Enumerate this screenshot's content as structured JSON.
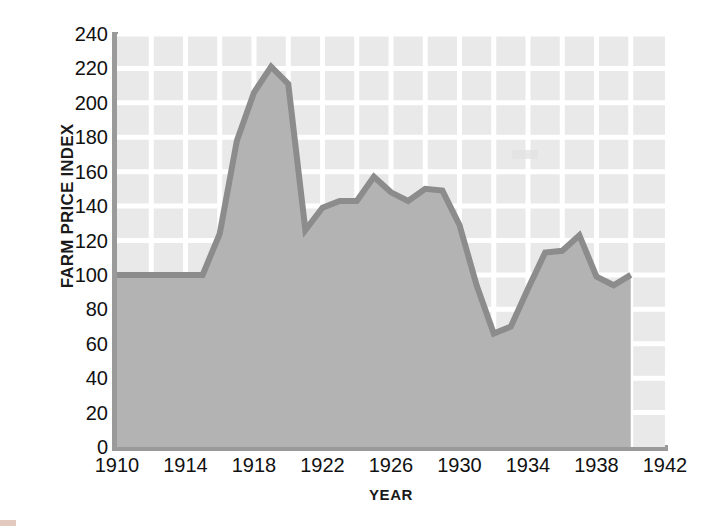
{
  "chart_data": {
    "type": "area",
    "title": "",
    "subtitle": "",
    "xlabel": "YEAR",
    "ylabel": "FARM PRICE INDEX",
    "xlim": [
      1910,
      1942
    ],
    "ylim": [
      0,
      240
    ],
    "grid": true,
    "legend": "none",
    "x_tick_labels": [
      "1910",
      "1914",
      "1918",
      "1922",
      "1926",
      "1930",
      "1934",
      "1938",
      "1942"
    ],
    "x_tick_values": [
      1910,
      1914,
      1918,
      1922,
      1926,
      1930,
      1934,
      1938,
      1942
    ],
    "x_gridline_values": [
      1912,
      1914,
      1916,
      1918,
      1920,
      1922,
      1924,
      1926,
      1928,
      1930,
      1932,
      1934,
      1936,
      1938,
      1940
    ],
    "y_tick_labels": [
      "0",
      "20",
      "40",
      "60",
      "80",
      "100",
      "120",
      "140",
      "160",
      "180",
      "200",
      "220",
      "240"
    ],
    "y_tick_values": [
      0,
      20,
      40,
      60,
      80,
      100,
      120,
      140,
      160,
      180,
      200,
      220,
      240
    ],
    "x": [
      1910,
      1911,
      1912,
      1913,
      1914,
      1915,
      1916,
      1917,
      1918,
      1919,
      1920,
      1921,
      1922,
      1923,
      1924,
      1925,
      1926,
      1927,
      1928,
      1929,
      1930,
      1931,
      1932,
      1933,
      1934,
      1935,
      1936,
      1937,
      1938,
      1939,
      1940
    ],
    "values": [
      100,
      100,
      100,
      100,
      100,
      100,
      124,
      178,
      206,
      221,
      211,
      126,
      139,
      143,
      143,
      157,
      148,
      143,
      150,
      149,
      129,
      94,
      66,
      70,
      92,
      113,
      114,
      123,
      99,
      94,
      100
    ],
    "series": [
      {
        "name": "Farm price index",
        "values": [
          100,
          100,
          100,
          100,
          100,
          100,
          124,
          178,
          206,
          221,
          211,
          126,
          139,
          143,
          143,
          157,
          148,
          143,
          150,
          149,
          129,
          94,
          66,
          70,
          92,
          113,
          114,
          123,
          99,
          94,
          100
        ]
      }
    ],
    "colors": {
      "line": "#8c8c8c",
      "fill": "#b3b3b3",
      "plot_background": "#e9e9e9",
      "gridline": "#ffffff",
      "axis_spine": "#9a9a9a",
      "text": "#111111"
    }
  }
}
